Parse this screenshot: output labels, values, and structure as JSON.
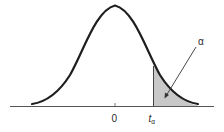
{
  "diagram": {
    "type": "t-distribution upper-tail area",
    "labels": {
      "zero": "0",
      "t_main": "t",
      "t_sub": "α",
      "alpha": "α"
    },
    "colors": {
      "curve": "#1e1e1e",
      "shade": "#c8c8c8",
      "axis": "#555555"
    }
  }
}
